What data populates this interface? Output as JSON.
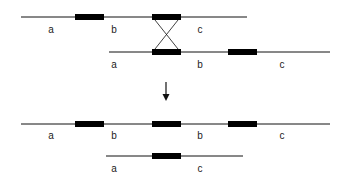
{
  "diagram": {
    "before": {
      "strand1": {
        "labels": [
          "a",
          "b",
          "c"
        ]
      },
      "strand2": {
        "labels": [
          "a",
          "b",
          "c"
        ]
      }
    },
    "after": {
      "product1": {
        "labels": [
          "a",
          "b",
          "b",
          "c"
        ]
      },
      "product2": {
        "labels": [
          "a",
          "c"
        ]
      }
    },
    "colors": {
      "line": "#111111",
      "block": "#000000"
    }
  }
}
